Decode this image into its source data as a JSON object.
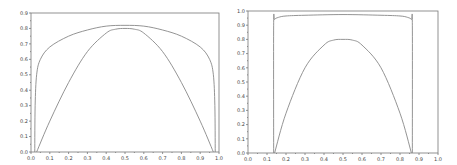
{
  "chart_data": [
    {
      "type": "line",
      "title": "",
      "xlabel": "",
      "ylabel": "",
      "xlim": [
        0.0,
        1.0
      ],
      "ylim": [
        0.0,
        0.9
      ],
      "grid": false,
      "x_ticks": [
        "0.0",
        "0.1",
        "0.2",
        "0.3",
        "0.4",
        "0.5",
        "0.6",
        "0.7",
        "0.8",
        "0.9",
        "1.0"
      ],
      "y_ticks": [
        "0.0",
        "0.1",
        "0.2",
        "0.3",
        "0.4",
        "0.5",
        "0.6",
        "0.7",
        "0.8",
        "0.9"
      ],
      "series": [
        {
          "name": "outer",
          "x": [
            0.02,
            0.022,
            0.03,
            0.05,
            0.1,
            0.2,
            0.3,
            0.4,
            0.5,
            0.6,
            0.7,
            0.8,
            0.9,
            0.95,
            0.97,
            0.978,
            0.98
          ],
          "y": [
            0.0,
            0.3,
            0.5,
            0.6,
            0.68,
            0.75,
            0.79,
            0.815,
            0.82,
            0.815,
            0.79,
            0.75,
            0.68,
            0.6,
            0.5,
            0.3,
            0.0
          ]
        },
        {
          "name": "inner",
          "x": [
            0.03,
            0.1,
            0.2,
            0.3,
            0.4,
            0.45,
            0.5,
            0.55,
            0.6,
            0.7,
            0.8,
            0.9,
            0.97
          ],
          "y": [
            0.0,
            0.2,
            0.45,
            0.65,
            0.77,
            0.795,
            0.8,
            0.795,
            0.77,
            0.65,
            0.45,
            0.2,
            0.0
          ]
        }
      ]
    },
    {
      "type": "line",
      "title": "",
      "xlabel": "",
      "ylabel": "",
      "xlim": [
        0.0,
        1.0
      ],
      "ylim": [
        0.0,
        1.0
      ],
      "grid": false,
      "x_ticks": [
        "0.0",
        "0.1",
        "0.2",
        "0.3",
        "0.4",
        "0.5",
        "0.6",
        "0.7",
        "0.8",
        "0.9",
        "1.0"
      ],
      "y_ticks": [
        "0.0",
        "0.1",
        "0.2",
        "0.3",
        "0.4",
        "0.5",
        "0.6",
        "0.7",
        "0.8",
        "0.9",
        "1.0"
      ],
      "series": [
        {
          "name": "outer",
          "x": [
            0.135,
            0.135,
            0.14,
            0.16,
            0.2,
            0.3,
            0.5,
            0.7,
            0.8,
            0.84,
            0.86,
            0.865,
            0.865
          ],
          "y": [
            0.0,
            0.9,
            0.94,
            0.955,
            0.965,
            0.97,
            0.975,
            0.97,
            0.965,
            0.955,
            0.94,
            0.9,
            0.0
          ]
        },
        {
          "name": "inner",
          "x": [
            0.14,
            0.2,
            0.3,
            0.4,
            0.45,
            0.5,
            0.55,
            0.6,
            0.7,
            0.8,
            0.86
          ],
          "y": [
            0.0,
            0.28,
            0.6,
            0.76,
            0.795,
            0.8,
            0.795,
            0.76,
            0.6,
            0.28,
            0.0
          ]
        }
      ]
    }
  ]
}
